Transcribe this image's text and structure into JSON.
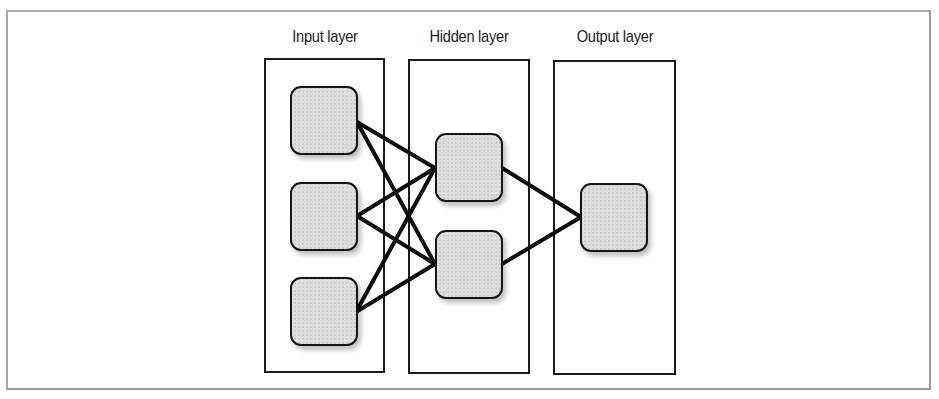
{
  "diagram": {
    "title": "",
    "layers": [
      {
        "label": "Input layer",
        "nodes": 3
      },
      {
        "label": "Hidden layer",
        "nodes": 2
      },
      {
        "label": "Output layer",
        "nodes": 1
      }
    ],
    "edges": [
      {
        "from": "input-1",
        "to": "hidden-1"
      },
      {
        "from": "input-1",
        "to": "hidden-2"
      },
      {
        "from": "input-2",
        "to": "hidden-1"
      },
      {
        "from": "input-2",
        "to": "hidden-2"
      },
      {
        "from": "input-3",
        "to": "hidden-1"
      },
      {
        "from": "input-3",
        "to": "hidden-2"
      },
      {
        "from": "hidden-1",
        "to": "output-1"
      },
      {
        "from": "hidden-2",
        "to": "output-1"
      }
    ],
    "colors": {
      "node_fill": "#dcdcdc",
      "node_border": "#151515",
      "edge": "#0d0d0d",
      "box_border": "#1a1a1a",
      "frame_border": "#a8a8a8"
    }
  }
}
